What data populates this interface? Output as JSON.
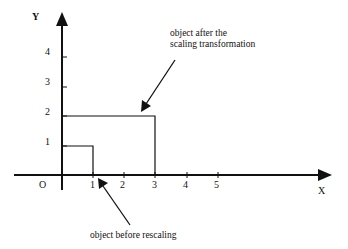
{
  "diagram": {
    "type": "coordinate-scaling-illustration",
    "axes": {
      "x_label": "X",
      "y_label": "Y",
      "origin_label": "O",
      "x_ticks": [
        "1",
        "2",
        "3",
        "4",
        "5"
      ],
      "y_ticks": [
        "1",
        "2",
        "3",
        "4"
      ]
    },
    "objects": [
      {
        "name": "original",
        "x": [
          0,
          1
        ],
        "y": [
          0,
          1
        ]
      },
      {
        "name": "scaled",
        "x": [
          0,
          3
        ],
        "y": [
          0,
          2
        ]
      }
    ],
    "annotations": {
      "after": "object after the\nscaling transformation",
      "before": "object before rescaling"
    }
  }
}
